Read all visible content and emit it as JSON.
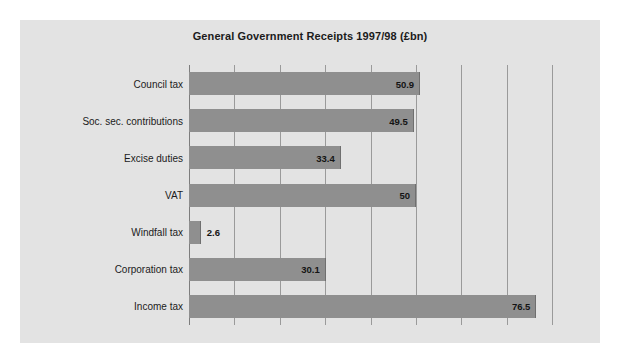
{
  "chart_data": {
    "type": "bar",
    "orientation": "horizontal",
    "title": "General Government Receipts 1997/98 (£bn)",
    "xlabel": "",
    "ylabel": "",
    "categories": [
      "Council tax",
      "Soc. sec. contributions",
      "Excise duties",
      "VAT",
      "Windfall tax",
      "Corporation tax",
      "Income tax"
    ],
    "values": [
      50.9,
      49.5,
      33.4,
      50,
      2.6,
      30.1,
      76.5
    ],
    "value_labels": [
      "50.9",
      "49.5",
      "33.4",
      "50",
      "2.6",
      "30.1",
      "76.5"
    ],
    "xlim": [
      0,
      85
    ],
    "gridline_values": [
      10,
      20,
      30,
      40,
      50,
      60,
      70,
      80
    ],
    "grid": true,
    "legend": false,
    "colors": {
      "bar": "#8f8f8f",
      "bar_edge": "#6f6f6f",
      "plot_background": "#e3e3e3",
      "gridline": "#9a9a9a",
      "axis": "#7d7d7d",
      "title_text": "#1b1b1b",
      "label_text": "#1b1b1b",
      "page_background": "#ffffff"
    }
  }
}
